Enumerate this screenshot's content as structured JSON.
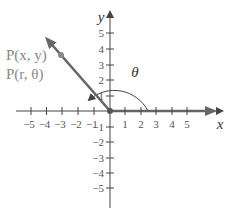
{
  "diagram": {
    "x_axis": {
      "label": "x",
      "ticks": [
        "−5",
        "−4",
        "−3",
        "−2",
        "−1",
        "1",
        "2",
        "3",
        "4",
        "5"
      ]
    },
    "y_axis": {
      "label": "y",
      "ticks": [
        "5",
        "4",
        "3",
        "2",
        "1",
        "−1",
        "−2",
        "−3",
        "−4",
        "−5"
      ]
    },
    "point_labels": {
      "rectangular": "P(x, y)",
      "polar": "P(r, θ)"
    },
    "angle_label": "θ",
    "colors": {
      "axis": "#444444",
      "ray": "#666666",
      "point": "#888888",
      "label": "#888888"
    }
  }
}
